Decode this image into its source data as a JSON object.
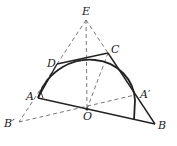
{
  "diagram": {
    "type": "geometry",
    "points": {
      "E": {
        "label": "E",
        "x": 86,
        "y": 20
      },
      "C": {
        "label": "C",
        "x": 108,
        "y": 53
      },
      "D": {
        "label": "D",
        "x": 57,
        "y": 64
      },
      "A": {
        "label": "A",
        "x": 38,
        "y": 98
      },
      "O": {
        "label": "O",
        "x": 87,
        "y": 109
      },
      "B": {
        "label": "B",
        "x": 155,
        "y": 124
      },
      "A_prime": {
        "label": "A′",
        "x": 135,
        "y": 95
      },
      "B_prime": {
        "label": "B′",
        "x": 19,
        "y": 122
      }
    },
    "solid_segments": [
      "A-B",
      "A-D",
      "D-C",
      "C-B"
    ],
    "dashed_segments": [
      "E-B′",
      "E-O",
      "E-C",
      "O-C",
      "O-A′",
      "O-B′"
    ],
    "arc": "semi-ellipse from A over top to foot near B on segment AB"
  }
}
